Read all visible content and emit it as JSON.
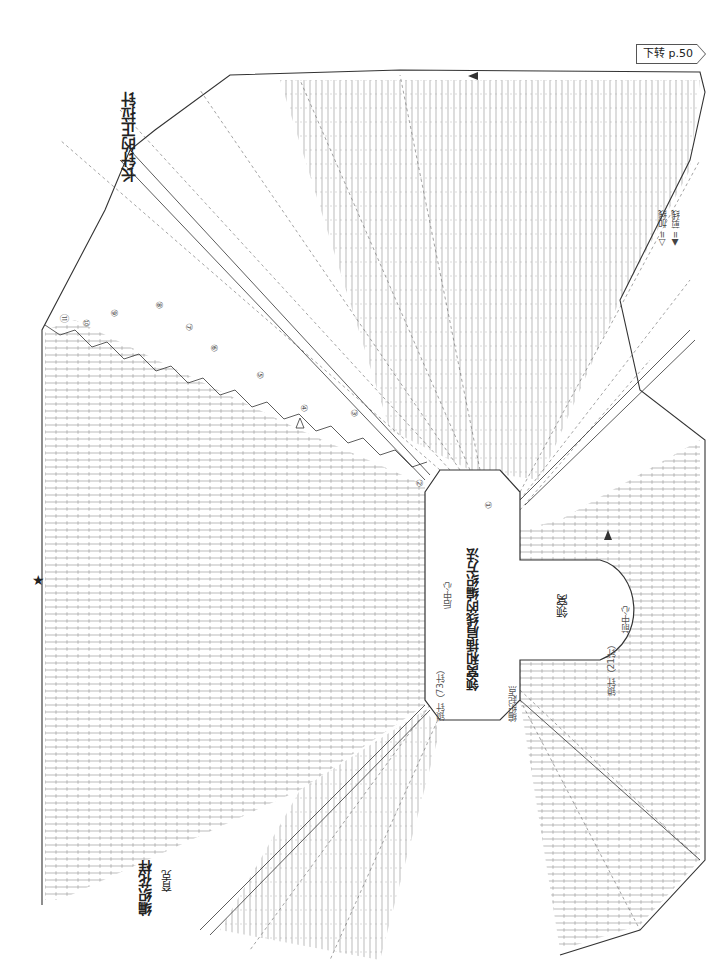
{
  "page": {
    "next_page_label": "下转 p.50"
  },
  "chart": {
    "title": "领窝和插肩线的编织方法",
    "pattern_label": "编织花样",
    "section_label": "育克",
    "callout_label": "长针的正拉针",
    "neckline_label": "领窝",
    "back_center_label": "后中心",
    "front_center_label": "前中心",
    "start_point_label": "编织起点",
    "back_pickup_label": "锁针（73针）",
    "front_pickup_label": "锁针（21针）",
    "star_marker": "★",
    "row_markers": [
      "①",
      "②",
      "③",
      "④",
      "⑤",
      "⑥",
      "⑦",
      "⑧",
      "⑨",
      "⑩",
      "⑪"
    ]
  },
  "legend": {
    "items": [
      {
        "symbol": "△",
        "label": "= 加线"
      },
      {
        "symbol": "▲",
        "label": "= 剪线"
      }
    ]
  },
  "colors": {
    "ink": "#333333",
    "grid": "#777777",
    "paper": "#ffffff"
  }
}
